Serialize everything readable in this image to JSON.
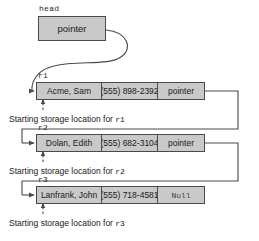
{
  "diagram": {
    "head": {
      "label": "head",
      "value": "pointer"
    },
    "nodes": [
      {
        "var_label": "r1",
        "name": "Acme, Sam",
        "phone": "(555) 898-2392",
        "pointer": "pointer",
        "pointer_is_null": false,
        "caption_prefix": "Starting storage location for ",
        "caption_var": "r1"
      },
      {
        "var_label": "r2",
        "name": "Dolan, Edith",
        "phone": "(555) 682-3104",
        "pointer": "pointer",
        "pointer_is_null": false,
        "caption_prefix": "Starting storage location for ",
        "caption_var": "r2"
      },
      {
        "var_label": "r3",
        "name": "Lanfrank, John",
        "phone": "(555) 718-4581",
        "pointer": "Null",
        "pointer_is_null": true,
        "caption_prefix": "Starting storage location for ",
        "caption_var": "r3"
      }
    ],
    "colors": {
      "box_fill": "#c9c9c9",
      "box_border": "#4a4a4a",
      "wire": "#4a4a4a",
      "background": "#ffffff",
      "text": "#1a1a1a"
    }
  }
}
